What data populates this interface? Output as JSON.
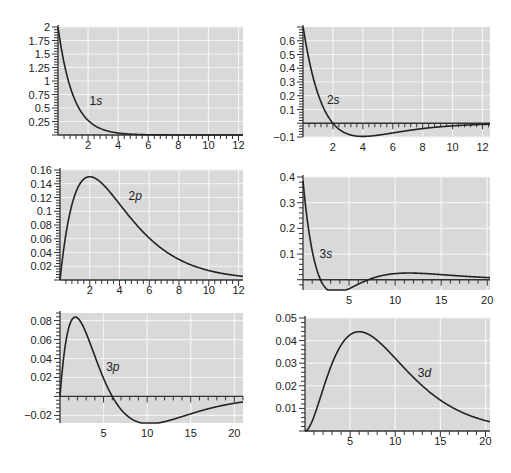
{
  "colors": {
    "plot_background": "#d9d9d9",
    "grid": "#f4f4f4",
    "curve": "#222222",
    "axis": "#333333"
  },
  "chart_data": [
    {
      "id": "1s",
      "type": "line",
      "label": "1s",
      "function": "R10",
      "xlim": [
        0,
        12.3
      ],
      "ylim": [
        0,
        2
      ],
      "xticks": [
        2,
        4,
        6,
        8,
        10,
        12
      ],
      "yticks": [
        0.25,
        0.5,
        0.75,
        1,
        1.25,
        1.5,
        1.75,
        2
      ],
      "ytick_labels": [
        "0.25",
        "0.5",
        "0.75",
        "1",
        "1.25",
        "1.5",
        "1.75",
        "2"
      ],
      "label_pos": [
        2.1,
        0.55
      ],
      "x": [
        0,
        0.5,
        1,
        1.5,
        2,
        3,
        4,
        5,
        6,
        8,
        10,
        12
      ],
      "y": [
        2.0,
        1.213,
        0.736,
        0.446,
        0.271,
        0.1,
        0.037,
        0.013,
        0.005,
        0.0007,
        0.0001,
        0.0
      ],
      "box": {
        "left": 58,
        "top": 27,
        "right": 243,
        "bottom": 135
      }
    },
    {
      "id": "2s",
      "type": "line",
      "label": "2s",
      "function": "R20",
      "xlim": [
        0,
        12.5
      ],
      "ylim": [
        -0.1,
        0.7
      ],
      "xticks": [
        2,
        4,
        6,
        8,
        10,
        12
      ],
      "yticks": [
        -0.1,
        0.1,
        0.2,
        0.3,
        0.4,
        0.5,
        0.6
      ],
      "ytick_labels": [
        "−0.1",
        "0.1",
        "0.2",
        "0.3",
        "0.4",
        "0.5",
        "0.6"
      ],
      "label_pos": [
        1.6,
        0.14
      ],
      "x": [
        0,
        0.5,
        1,
        1.5,
        2,
        3,
        4,
        5,
        6,
        8,
        10,
        12
      ],
      "y": [
        0.707,
        0.413,
        0.214,
        0.083,
        0.0,
        -0.078,
        -0.096,
        -0.088,
        -0.07,
        -0.037,
        -0.016,
        -0.006
      ],
      "box": {
        "left": 303,
        "top": 27,
        "right": 490,
        "bottom": 137
      }
    },
    {
      "id": "2p",
      "type": "line",
      "label": "2p",
      "function": "R21",
      "xlim": [
        0,
        12.3
      ],
      "ylim": [
        0,
        0.16
      ],
      "xticks": [
        2,
        4,
        6,
        8,
        10,
        12
      ],
      "yticks": [
        0.02,
        0.04,
        0.06,
        0.08,
        0.1,
        0.12,
        0.14,
        0.16
      ],
      "ytick_labels": [
        "0.02",
        "0.04",
        "0.06",
        "0.08",
        "0.1",
        "0.12",
        "0.14",
        "0.16"
      ],
      "label_pos": [
        4.6,
        0.117
      ],
      "x": [
        0,
        0.5,
        1,
        1.5,
        2,
        3,
        4,
        5,
        6,
        8,
        10,
        12
      ],
      "y": [
        0.0,
        0.08,
        0.124,
        0.146,
        0.152,
        0.138,
        0.11,
        0.08,
        0.056,
        0.025,
        0.01,
        0.004
      ],
      "box": {
        "left": 60,
        "top": 170,
        "right": 243,
        "bottom": 280
      }
    },
    {
      "id": "3s",
      "type": "line",
      "label": "3s",
      "function": "R30",
      "xlim": [
        0,
        20.3
      ],
      "ylim": [
        -0.04,
        0.4
      ],
      "xticks": [
        5,
        10,
        15,
        20
      ],
      "yticks": [
        0.1,
        0.2,
        0.3,
        0.4
      ],
      "ytick_labels": [
        "0.1",
        "0.2",
        "0.3",
        "0.4"
      ],
      "label_pos": [
        1.8,
        0.085
      ],
      "x": [
        0,
        1,
        1.9,
        3,
        3.5,
        5,
        7.1,
        9,
        11.5,
        14,
        17,
        20
      ],
      "y": [
        0.385,
        0.146,
        0.0,
        -0.046,
        -0.049,
        -0.036,
        0.0,
        0.021,
        0.028,
        0.024,
        0.015,
        0.008
      ],
      "box": {
        "left": 303,
        "top": 177,
        "right": 490,
        "bottom": 290
      }
    },
    {
      "id": "3p",
      "type": "line",
      "label": "3p",
      "function": "R31",
      "xlim": [
        0,
        21
      ],
      "ylim": [
        -0.028,
        0.088
      ],
      "xticks": [
        5,
        10,
        15,
        20
      ],
      "yticks": [
        -0.02,
        0.02,
        0.04,
        0.06,
        0.08
      ],
      "ytick_labels": [
        "−0.02",
        "0.02",
        "0.04",
        "0.06",
        "0.08"
      ],
      "label_pos": [
        5.3,
        0.027
      ],
      "x": [
        0,
        1,
        2,
        3,
        4,
        5,
        6,
        8,
        10,
        12,
        15,
        20
      ],
      "y": [
        0.0,
        0.072,
        0.084,
        0.068,
        0.043,
        0.019,
        0.0,
        -0.02,
        -0.025,
        -0.023,
        -0.016,
        -0.007
      ],
      "box": {
        "left": 60,
        "top": 313,
        "right": 243,
        "bottom": 423
      }
    },
    {
      "id": "3d",
      "type": "line",
      "label": "3d",
      "function": "R32",
      "xlim": [
        0,
        20.5
      ],
      "ylim": [
        0,
        0.05
      ],
      "xticks": [
        5,
        10,
        15,
        20
      ],
      "yticks": [
        0.01,
        0.02,
        0.03,
        0.04,
        0.05
      ],
      "ytick_labels": [
        "0.01",
        "0.02",
        "0.03",
        "0.04",
        "0.05"
      ],
      "label_pos": [
        12.5,
        0.024
      ],
      "x": [
        0,
        1,
        2,
        3,
        4,
        5,
        6,
        8,
        10,
        12,
        15,
        20
      ],
      "y": [
        0.0,
        0.005,
        0.016,
        0.028,
        0.037,
        0.043,
        0.044,
        0.038,
        0.028,
        0.019,
        0.01,
        0.004
      ],
      "box": {
        "left": 305,
        "top": 318,
        "right": 490,
        "bottom": 431
      }
    }
  ]
}
